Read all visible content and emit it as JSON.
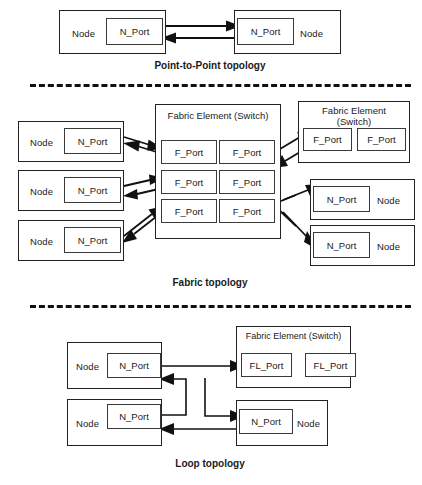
{
  "figure": {
    "sections": [
      {
        "id": "point-to-point",
        "caption": "Point-to-Point topology"
      },
      {
        "id": "fabric",
        "caption": "Fabric topology"
      },
      {
        "id": "loop",
        "caption": "Loop topology"
      }
    ]
  },
  "labels": {
    "node": "Node",
    "n_port": "N_Port",
    "f_port": "F_Port",
    "fl_port": "FL_Port",
    "fabric_element": "Fabric Element (Switch)"
  },
  "point_to_point": {
    "left_node": {
      "node_label": "Node",
      "port_label": "N_Port"
    },
    "right_node": {
      "node_label": "Node",
      "port_label": "N_Port"
    },
    "caption": "Point-to-Point topology"
  },
  "fabric": {
    "caption": "Fabric topology",
    "left_nodes": [
      {
        "node_label": "Node",
        "port_label": "N_Port"
      },
      {
        "node_label": "Node",
        "port_label": "N_Port"
      },
      {
        "node_label": "Node",
        "port_label": "N_Port"
      }
    ],
    "center_switch": {
      "title": "Fabric Element (Switch)",
      "ports": [
        "F_Port",
        "F_Port",
        "F_Port",
        "F_Port",
        "F_Port",
        "F_Port"
      ]
    },
    "right_switch": {
      "title": "Fabric Element (Switch)",
      "ports": [
        "F_Port",
        "F_Port"
      ]
    },
    "right_nodes": [
      {
        "node_label": "Node",
        "port_label": "N_Port"
      },
      {
        "node_label": "Node",
        "port_label": "N_Port"
      }
    ]
  },
  "loop": {
    "caption": "Loop topology",
    "left_nodes": [
      {
        "node_label": "Node",
        "port_label": "N_Port"
      },
      {
        "node_label": "Node",
        "port_label": "N_Port"
      }
    ],
    "switch": {
      "title": "Fabric Element (Switch)",
      "ports": [
        "FL_Port",
        "FL_Port"
      ]
    },
    "right_node": {
      "node_label": "Node",
      "port_label": "N_Port"
    }
  },
  "colors": {
    "line": "#111111",
    "box_border": "#222222",
    "background": "#ffffff"
  }
}
